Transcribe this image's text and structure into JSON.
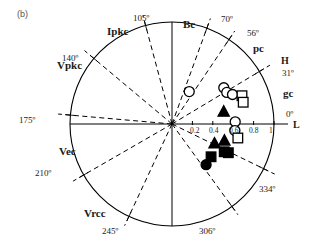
{
  "figure": {
    "panel_label": "(b)",
    "background": "#ffffff",
    "ink": "#000000"
  },
  "chart_data": {
    "type": "scatter",
    "projection": "polar",
    "title": "",
    "subtitle": "",
    "panel": "(b)",
    "radial_axis": {
      "label": "L",
      "ticks": [
        "0.2",
        "0.4",
        "0.6",
        "0.8",
        "1"
      ],
      "tick_values": [
        0.2,
        0.4,
        0.6,
        0.8,
        1.0
      ],
      "rlim": [
        0,
        1
      ],
      "origin_label": "0"
    },
    "angular_axis": {
      "label": "H",
      "zero_label": "0º",
      "direction": "counterclockwise",
      "grid": "dashed-rays"
    },
    "reference_rays": [
      {
        "angle": 31,
        "label": "31º",
        "style": "dashed"
      },
      {
        "angle": 56,
        "label": "56º",
        "style": "dashed"
      },
      {
        "angle": 70,
        "label": "70º",
        "style": "dashed"
      },
      {
        "angle": 105,
        "label": "105º",
        "style": "dashed"
      },
      {
        "angle": 140,
        "label": "140º",
        "style": "dashed"
      },
      {
        "angle": 175,
        "label": "175º",
        "style": "dashed"
      },
      {
        "angle": 210,
        "label": "210º",
        "style": "dashed"
      },
      {
        "angle": 245,
        "label": "245º",
        "style": "dashed"
      },
      {
        "angle": 306,
        "label": "306º",
        "style": "dashed"
      },
      {
        "angle": 334,
        "label": "334º",
        "style": "dashed"
      }
    ],
    "cardinal_axes": [
      {
        "angle": 0,
        "label": "0º",
        "style": "solid"
      },
      {
        "angle": 90,
        "label": "Bc",
        "style": "solid"
      },
      {
        "angle": 180,
        "label": "",
        "style": "solid"
      },
      {
        "angle": 270,
        "label": "",
        "style": "solid"
      }
    ],
    "sector_labels": [
      {
        "name": "Bc",
        "angle": 90,
        "text": "Bc"
      },
      {
        "name": "pc",
        "angle": 45,
        "text": "pc"
      },
      {
        "name": "gc",
        "angle": 15,
        "text": "gc"
      },
      {
        "name": "Ipkc",
        "angle": 122,
        "text": "Ipkc"
      },
      {
        "name": "Vpkc",
        "angle": 157,
        "text": "Vpkc"
      },
      {
        "name": "Vec",
        "angle": 193,
        "text": "Vec"
      },
      {
        "name": "Vrcc",
        "angle": 228,
        "text": "Vrcc"
      }
    ],
    "axis_titles": {
      "angular": "H",
      "radial": "L"
    },
    "series": [
      {
        "name": "open-circle",
        "marker": "open-circle",
        "fill": "none",
        "stroke": "#000000",
        "points": [
          {
            "L": 0.36,
            "H": 62
          },
          {
            "L": 0.62,
            "H": 35
          },
          {
            "L": 0.62,
            "H": 30
          },
          {
            "L": 0.66,
            "H": 26
          },
          {
            "L": 0.62,
            "H": 2
          },
          {
            "L": 0.62,
            "H": -6
          }
        ]
      },
      {
        "name": "open-square",
        "marker": "open-square",
        "fill": "none",
        "stroke": "#000000",
        "points": [
          {
            "L": 0.74,
            "H": 22
          },
          {
            "L": 0.73,
            "H": 17
          },
          {
            "L": 0.66,
            "H": -12
          }
        ]
      },
      {
        "name": "filled-triangle",
        "marker": "filled-triangle",
        "fill": "#000000",
        "stroke": "#000000",
        "points": [
          {
            "L": 0.52,
            "H": 13
          },
          {
            "L": 0.54,
            "H": -18
          },
          {
            "L": 0.46,
            "H": -25
          }
        ]
      },
      {
        "name": "filled-square",
        "marker": "filled-square",
        "fill": "#000000",
        "stroke": "#000000",
        "points": [
          {
            "L": 0.58,
            "H": -28
          },
          {
            "L": 0.62,
            "H": -27
          },
          {
            "L": 0.5,
            "H": -40
          }
        ]
      },
      {
        "name": "filled-circle",
        "marker": "filled-circle",
        "fill": "#000000",
        "stroke": "#000000",
        "points": [
          {
            "L": 0.52,
            "H": -50
          }
        ]
      }
    ]
  },
  "labels": {
    "Bc": "Bc",
    "pc": "pc",
    "gc": "gc",
    "Ipkc": "Ipkc",
    "Vpkc": "Vpkc",
    "Vec": "Vec",
    "Vrcc": "Vrcc",
    "H": "H",
    "L": "L",
    "a105": "105º",
    "a70": "70º",
    "a56": "56º",
    "a31": "31º",
    "a0": "0º",
    "a140": "140º",
    "a175": "175º",
    "a210": "210º",
    "a245": "245º",
    "a306": "306º",
    "a334": "334º",
    "t02": "0.2",
    "t04": "0.4",
    "t06": "0.6",
    "t08": "0.8",
    "t1": "1"
  }
}
